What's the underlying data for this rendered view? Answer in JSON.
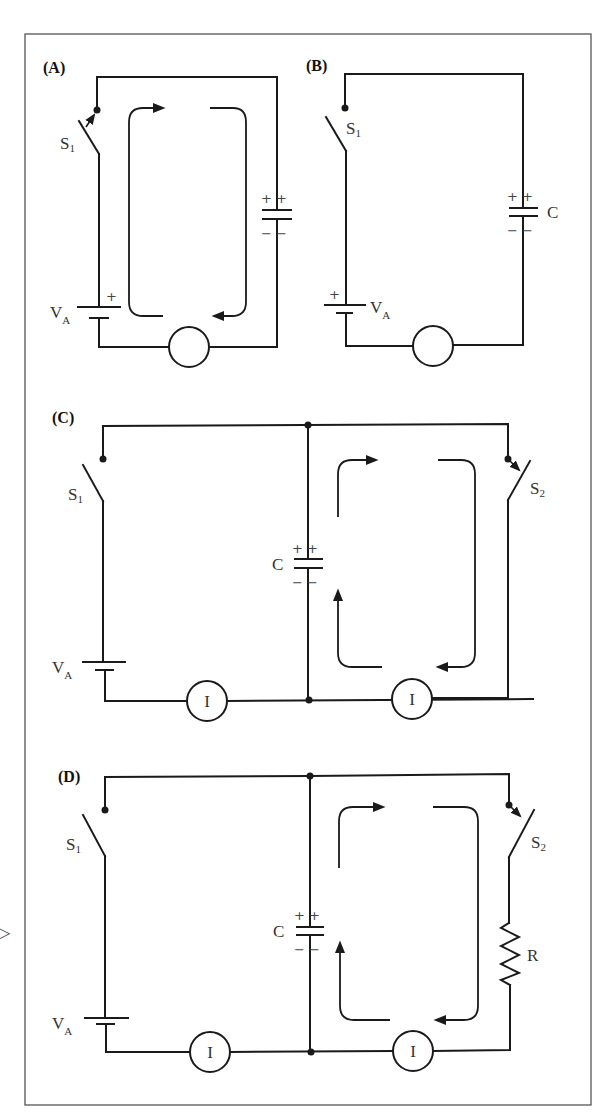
{
  "figure": {
    "side_marker": "▷",
    "panels": [
      {
        "id": "A",
        "label": "(A)",
        "switch": {
          "name": "S",
          "sub": "1",
          "state": "closing"
        },
        "battery": {
          "name": "V",
          "sub": "A",
          "polarity": "+"
        },
        "capacitor": {
          "top_signs": "+ +",
          "bottom_signs": "− −"
        },
        "meter": {
          "label": ""
        }
      },
      {
        "id": "B",
        "label": "(B)",
        "switch": {
          "name": "S",
          "sub": "1",
          "state": "open"
        },
        "battery": {
          "name": "V",
          "sub": "A",
          "polarity": "+"
        },
        "capacitor": {
          "name": "C",
          "top_signs": "+ +",
          "bottom_signs": "− −"
        },
        "meter": {
          "label": ""
        }
      },
      {
        "id": "C",
        "label": "(C)",
        "switch1": {
          "name": "S",
          "sub": "1",
          "state": "open"
        },
        "switch2": {
          "name": "S",
          "sub": "2",
          "state": "closing"
        },
        "battery": {
          "name": "V",
          "sub": "A"
        },
        "capacitor": {
          "name": "C",
          "top_signs": "+ +",
          "bottom_signs": "− −"
        },
        "meters": [
          {
            "label": "I"
          },
          {
            "label": "I"
          }
        ]
      },
      {
        "id": "D",
        "label": "(D)",
        "switch1": {
          "name": "S",
          "sub": "1",
          "state": "open"
        },
        "switch2": {
          "name": "S",
          "sub": "2",
          "state": "closing"
        },
        "battery": {
          "name": "V",
          "sub": "A"
        },
        "capacitor": {
          "name": "C",
          "top_signs": "+ +",
          "bottom_signs": "− −"
        },
        "resistor": {
          "name": "R"
        },
        "meters": [
          {
            "label": "I"
          },
          {
            "label": "I"
          }
        ]
      }
    ]
  }
}
